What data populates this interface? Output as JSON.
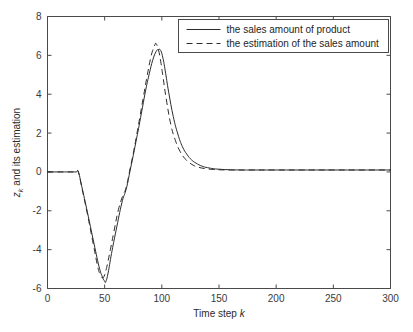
{
  "chart_data": {
    "type": "line",
    "title": "",
    "xlabel": "Time step k",
    "xlabel_plain": "Time step ",
    "xlabel_italic": "k",
    "ylabel": "z_k and its estimation",
    "ylabel_main": "z",
    "ylabel_sub": "k",
    "ylabel_rest": " and its estimation",
    "xlim": [
      0,
      300
    ],
    "ylim": [
      -6,
      8
    ],
    "xticks": [
      0,
      50,
      100,
      150,
      200,
      250,
      300
    ],
    "xtick_labels": [
      "0",
      "50",
      "100",
      "150",
      "200",
      "250",
      "300"
    ],
    "yticks": [
      -6,
      -4,
      -2,
      0,
      2,
      4,
      6,
      8
    ],
    "ytick_labels": [
      "-6",
      "-4",
      "-2",
      "0",
      "2",
      "4",
      "6",
      "8"
    ],
    "grid": false,
    "legend_position": "top-right",
    "line_color": "#2b2b2b",
    "axis_color": "#4a4a4a",
    "background": "#ffffff",
    "series": [
      {
        "name": "the sales amount of product",
        "style": "solid",
        "x": [
          0,
          5,
          10,
          15,
          20,
          25,
          27,
          30,
          35,
          40,
          45,
          48,
          50,
          51,
          53,
          56,
          60,
          65,
          68,
          70,
          72,
          75,
          78,
          80,
          83,
          86,
          89,
          92,
          95,
          97,
          99,
          101,
          103,
          106,
          110,
          114,
          118,
          122,
          126,
          130,
          135,
          140,
          145,
          150,
          160,
          170,
          180,
          200,
          220,
          250,
          280,
          300
        ],
        "y": [
          0,
          0,
          0,
          0,
          0,
          0,
          0,
          -0.75,
          -2.1,
          -3.5,
          -4.85,
          -5.4,
          -5.62,
          -5.65,
          -5.2,
          -4.2,
          -3.0,
          -1.6,
          -1.05,
          -0.6,
          0.0,
          0.85,
          1.75,
          2.35,
          3.3,
          4.25,
          5.05,
          5.75,
          6.2,
          6.3,
          6.25,
          5.85,
          5.2,
          4.1,
          2.85,
          1.95,
          1.3,
          0.9,
          0.62,
          0.45,
          0.3,
          0.22,
          0.17,
          0.14,
          0.11,
          0.1,
          0.1,
          0.1,
          0.1,
          0.1,
          0.1,
          0.1
        ]
      },
      {
        "name": "the estimation of the sales amount",
        "style": "dashed",
        "x": [
          0,
          5,
          10,
          15,
          20,
          25,
          27,
          30,
          35,
          40,
          44,
          46,
          48,
          50,
          52,
          55,
          58,
          62,
          66,
          68,
          70,
          72,
          75,
          78,
          81,
          84,
          87,
          90,
          92,
          94,
          95,
          97,
          99,
          101,
          104,
          108,
          112,
          116,
          120,
          124,
          128,
          132,
          138,
          144,
          150,
          160,
          175,
          200,
          230,
          260,
          300
        ],
        "y": [
          0,
          0,
          0,
          0,
          0,
          0,
          0,
          -0.8,
          -2.2,
          -3.7,
          -4.9,
          -5.25,
          -5.45,
          -5.3,
          -4.85,
          -4.0,
          -3.1,
          -1.95,
          -1.2,
          -0.95,
          -0.5,
          0.1,
          0.95,
          1.9,
          2.9,
          3.9,
          4.9,
          5.8,
          6.25,
          6.55,
          6.6,
          6.3,
          5.7,
          4.9,
          3.7,
          2.4,
          1.6,
          1.05,
          0.7,
          0.48,
          0.33,
          0.24,
          0.17,
          0.13,
          0.11,
          0.1,
          0.1,
          0.1,
          0.1,
          0.1,
          0.1
        ]
      }
    ]
  },
  "legend": {
    "items": [
      {
        "label": "the sales amount of product",
        "style": "solid"
      },
      {
        "label": "the estimation of the sales amount",
        "style": "dashed"
      }
    ]
  }
}
